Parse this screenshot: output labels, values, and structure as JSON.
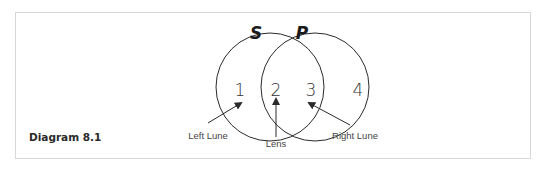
{
  "caption": "Diagram 8.1",
  "sets": [
    {
      "label": "S",
      "cx": 270,
      "cy": 87,
      "r": 54
    },
    {
      "label": "P",
      "cx": 315,
      "cy": 87,
      "r": 54
    }
  ],
  "regions": [
    {
      "label": "1",
      "x": 240,
      "y": 95
    },
    {
      "label": "2",
      "x": 276,
      "y": 95
    },
    {
      "label": "3",
      "x": 311,
      "y": 95
    },
    {
      "label": "4",
      "x": 358,
      "y": 95
    }
  ],
  "annotations": [
    {
      "text": "Left Lune",
      "x": 217,
      "y": 138
    },
    {
      "text": "Lens",
      "x": 276,
      "y": 146
    },
    {
      "text": "Right Lune",
      "x": 353,
      "y": 138
    }
  ],
  "colors": {
    "stroke": "#2a2a2a",
    "border": "#d8d8d8"
  }
}
